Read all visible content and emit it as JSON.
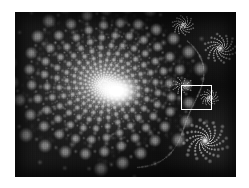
{
  "figure": {
    "kind": "fractal-image",
    "title": "",
    "caption": "",
    "colors": {
      "background": "#ffffff",
      "plate_background": "#0d0d0d",
      "fractal_bright": "#ffffff",
      "fractal_mid": "#9a9a9a",
      "fractal_dark": "#111111",
      "marker_stroke": "#ffffff"
    },
    "plate": {
      "x": 15,
      "y": 12,
      "width": 221,
      "height": 165
    },
    "zoom_marker": {
      "label": "",
      "x": 166,
      "y": 73,
      "width": 31,
      "height": 25,
      "stroke": "#ffffff",
      "stroke_width": 1.6
    },
    "features": {
      "main_spiral": {
        "center_x_pct": 40.5,
        "center_y_pct": 44,
        "arms": 7,
        "turns": 2.15
      },
      "satellites": [
        {
          "center_x_pct": 86,
          "center_y_pct": 78,
          "radius_pct": 13,
          "label": "lower-right-spiral"
        },
        {
          "center_x_pct": 93,
          "center_y_pct": 22,
          "radius_pct": 9,
          "label": "upper-right-spiral"
        },
        {
          "center_x_pct": 76,
          "center_y_pct": 8,
          "radius_pct": 6,
          "label": "top-spiral"
        },
        {
          "center_x_pct": 88,
          "center_y_pct": 52,
          "radius_pct": 5,
          "label": "mid-right-spiral"
        }
      ]
    }
  }
}
